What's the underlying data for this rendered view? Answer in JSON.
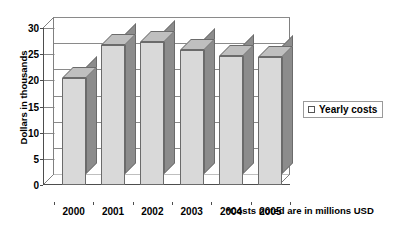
{
  "chart_data": {
    "type": "bar",
    "title": "",
    "categories": [
      "2000",
      "2001",
      "2002",
      "2003",
      "2004",
      "2005"
    ],
    "values": [
      20.5,
      26.8,
      27.3,
      25.8,
      24.6,
      24.5
    ],
    "series": [
      {
        "name": "Yearly costs",
        "values": [
          20.5,
          26.8,
          27.3,
          25.8,
          24.6,
          24.5
        ]
      }
    ],
    "xlabel": "",
    "ylabel": "Dollars in thousands",
    "ylim": [
      0,
      30
    ],
    "ytick_labels": [
      "0",
      "5",
      "10",
      "15",
      "20",
      "25",
      "30"
    ],
    "ytick_values": [
      0,
      5,
      10,
      15,
      20,
      25,
      30
    ],
    "grid": true,
    "legend_position": "right",
    "style": "3d-column",
    "annotations": [
      "*Costs noted are in millions USD"
    ]
  },
  "axes": {
    "y_title": "Dollars in thousands"
  },
  "legend": {
    "entries": [
      {
        "label": "Yearly costs",
        "swatch": "legend-swatch-yearly-costs"
      }
    ]
  },
  "footnote": {
    "text": "*Costs noted are in millions USD"
  },
  "colors": {
    "bar_front": "#d9d9d9",
    "bar_side": "#8c8c8c",
    "bar_top": "#bfbfbf",
    "bar_outline": "#6b6b6b",
    "gridline": "#8a8a8a",
    "axis": "#4d4d4d",
    "background": "#ffffff",
    "text": "#000000"
  }
}
